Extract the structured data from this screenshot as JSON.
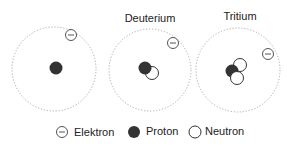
{
  "atoms": [
    {
      "name": "",
      "title_label": ""
    },
    {
      "name": "Deuterium",
      "title_label": "Deuterium"
    },
    {
      "name": "Tritium",
      "title_label": "Tritium"
    }
  ],
  "legend": {
    "electron_label": "Elektron",
    "proton_label": "Proton",
    "neutron_label": "Neutron"
  },
  "colors": {
    "proton": "#333333",
    "neutron_stroke": "#333333",
    "orbit": "#aaaaaa",
    "electron_stroke": "#555555"
  }
}
